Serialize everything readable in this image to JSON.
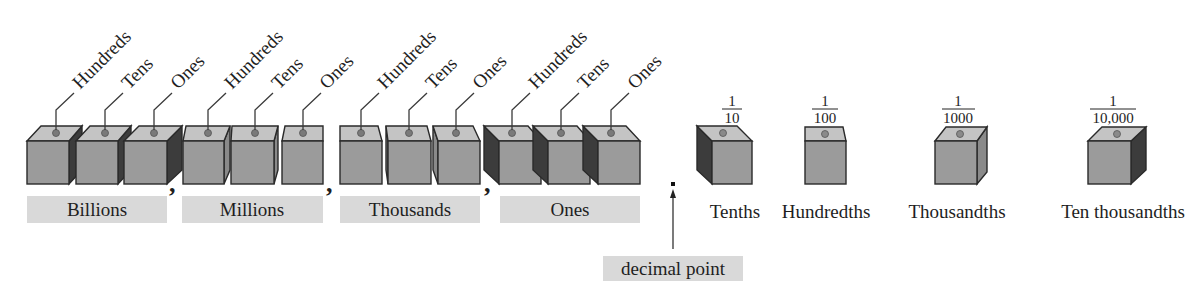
{
  "colors": {
    "cube_front": "#9b9b9b",
    "cube_top": "#c4c4c4",
    "cube_side_dark": "#3c3c3c",
    "cube_side_mid": "#8a8a8a",
    "label_box": "#d9d9d9",
    "text": "#1e1e1e",
    "background": "#ffffff"
  },
  "whole_number_periods": [
    {
      "name": "Billions",
      "places": [
        {
          "label": "Hundreds"
        },
        {
          "label": "Tens"
        },
        {
          "label": "Ones"
        }
      ]
    },
    {
      "name": "Millions",
      "places": [
        {
          "label": "Hundreds"
        },
        {
          "label": "Tens"
        },
        {
          "label": "Ones"
        }
      ]
    },
    {
      "name": "Thousands",
      "places": [
        {
          "label": "Hundreds"
        },
        {
          "label": "Tens"
        },
        {
          "label": "Ones"
        }
      ]
    },
    {
      "name": "Ones",
      "places": [
        {
          "label": "Hundreds"
        },
        {
          "label": "Tens"
        },
        {
          "label": "Ones"
        }
      ]
    }
  ],
  "separators": [
    ",",
    ",",
    ","
  ],
  "decimal_point": {
    "symbol": ".",
    "label": "decimal point"
  },
  "decimal_places": [
    {
      "name": "Tenths",
      "numerator": "1",
      "denominator": "10"
    },
    {
      "name": "Hundredths",
      "numerator": "1",
      "denominator": "100"
    },
    {
      "name": "Thousandths",
      "numerator": "1",
      "denominator": "1000"
    },
    {
      "name": "Ten thousandths",
      "numerator": "1",
      "denominator": "10,000"
    }
  ]
}
